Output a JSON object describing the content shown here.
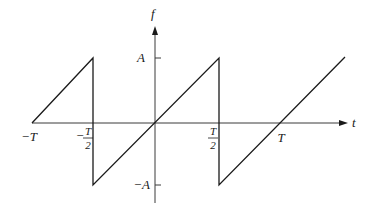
{
  "diagram": {
    "type": "sawtooth-waveform",
    "axes": {
      "horizontal_label": "t",
      "vertical_label": "f"
    },
    "x_ticks": [
      {
        "label": "−T",
        "value": "-T"
      },
      {
        "num": "T",
        "den": "2",
        "sign": "−",
        "value": "-T/2"
      },
      {
        "num": "T",
        "den": "2",
        "sign": "",
        "value": "T/2"
      },
      {
        "label": "T",
        "value": "T"
      }
    ],
    "y_ticks": [
      {
        "label": "A",
        "value": "A"
      },
      {
        "label": "−A",
        "value": "-A"
      }
    ],
    "segments": [
      {
        "from": [
          "-T",
          "0"
        ],
        "to": [
          "-T/2",
          "A"
        ]
      },
      {
        "from": [
          "-T/2",
          "A"
        ],
        "to": [
          "-T/2",
          "-A"
        ],
        "kind": "jump"
      },
      {
        "from": [
          "-T/2",
          "-A"
        ],
        "to": [
          "T/2",
          "A"
        ]
      },
      {
        "from": [
          "T/2",
          "A"
        ],
        "to": [
          "T/2",
          "-A"
        ],
        "kind": "jump"
      },
      {
        "from": [
          "T/2",
          "-A"
        ],
        "to": [
          "beyond T",
          "> A"
        ]
      }
    ],
    "colors": {
      "line": "#1a1a1a",
      "axis": "#3a3a3a",
      "background": "#ffffff"
    }
  }
}
